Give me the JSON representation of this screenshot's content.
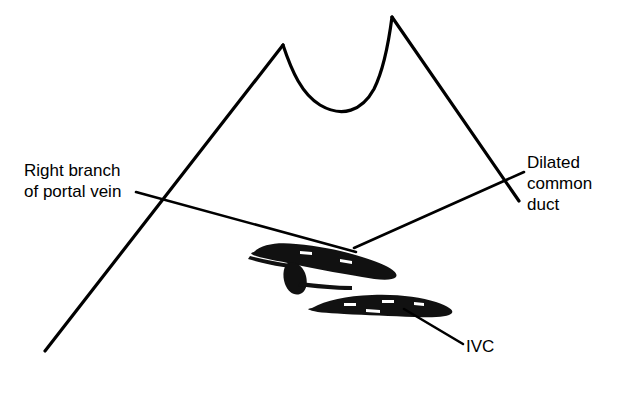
{
  "figure": {
    "kind": "ultrasound-sector-scan-line-drawing",
    "background_color": "#ffffff",
    "ink_color": "#000000",
    "width": 638,
    "height": 396
  },
  "annotations": {
    "portal_vein": {
      "name": "right-branch-of-portal-vein",
      "line1": "Right branch",
      "line2": "of portal vein"
    },
    "common_duct": {
      "name": "dilated-common-duct",
      "line1": "Dilated",
      "line2": "common",
      "line3": "duct"
    },
    "ivc": {
      "name": "inferior-vena-cava",
      "line1": "IVC"
    }
  },
  "scan_geometry": {
    "left_edge": {
      "x1": 45,
      "y1": 351,
      "x2": 283,
      "y2": 45
    },
    "right_edge": {
      "x1": 392,
      "y1": 17,
      "x2": 519,
      "y2": 201
    },
    "skin_curve": "M283,45 C292,70 300,92 318,104 C340,118 362,112 375,90 C385,70 389,42 392,17"
  },
  "leader_lines": {
    "portal_vein": {
      "x1": 136,
      "y1": 192,
      "x2": 356,
      "y2": 252
    },
    "common_duct": {
      "x1": 354,
      "y1": 248,
      "x2": 524,
      "y2": 172
    },
    "ivc": {
      "x1": 404,
      "y1": 309,
      "x2": 463,
      "y2": 344
    }
  },
  "structures": {
    "portal_vein_branch": {
      "label": "right branch of portal vein",
      "fill": "#000000"
    },
    "portal_vein_side_branch": {
      "label": "portal vein side branch",
      "fill": "#000000"
    },
    "ivc_vessel": {
      "label": "inferior vena cava",
      "fill": "#000000"
    }
  },
  "chart_data": {
    "type": "scatter",
    "title": "",
    "xlabel": "",
    "ylabel": "",
    "speckle_note": "liver parenchyma acoustic speckle rendered as short black dashes",
    "speckle_seed": 20240517,
    "speckle_count": 640
  }
}
